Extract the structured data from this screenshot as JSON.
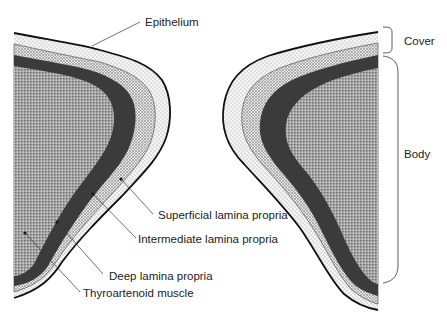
{
  "diagram": {
    "type": "anatomical cross-section",
    "labels": {
      "epithelium": "Epithelium",
      "superficial": "Superficial lamina propria",
      "intermediate": "Intermediate lamina propria",
      "deep": "Deep lamina propria",
      "muscle": "Thyroartenoid muscle"
    },
    "brackets": {
      "cover": "Cover",
      "body": "Body"
    },
    "colors": {
      "epithelium_line": "#111111",
      "superficial_fill": "#f2f2f2",
      "intermediate_fill": "#d9d9d9",
      "deep_fill": "#3a3a3a",
      "muscle_fill": "#9a9a9a",
      "background": "#ffffff"
    }
  }
}
